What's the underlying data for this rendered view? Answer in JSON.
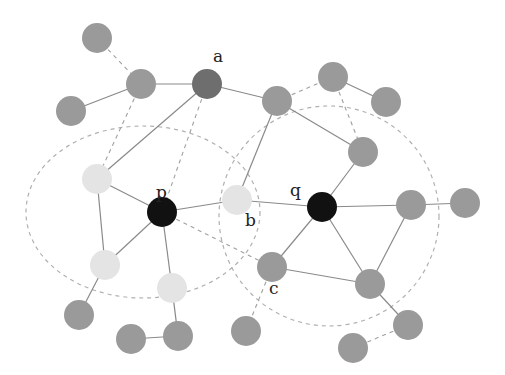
{
  "diagram": {
    "colors": {
      "background": "#ffffff",
      "node_dark": "#111111",
      "node_medium": "#6e6e6e",
      "node_gray": "#9a9a9a",
      "node_light": "#e4e4e4",
      "edge_solid": "#8a8a8a",
      "edge_dashed": "#a0a0a0",
      "region": "#b0b0b0"
    },
    "labels": {
      "a": "a",
      "p": "p",
      "q": "q",
      "b": "b",
      "c": "c"
    },
    "nodes": [
      {
        "id": "n1",
        "x": 97,
        "y": 38,
        "type": "gray"
      },
      {
        "id": "n2",
        "x": 71,
        "y": 111,
        "type": "gray"
      },
      {
        "id": "n3",
        "x": 141,
        "y": 84,
        "type": "gray"
      },
      {
        "id": "a",
        "x": 207,
        "y": 84,
        "type": "medium",
        "label": "a"
      },
      {
        "id": "n5",
        "x": 277,
        "y": 101,
        "type": "gray"
      },
      {
        "id": "n6",
        "x": 333,
        "y": 77,
        "type": "gray"
      },
      {
        "id": "n7",
        "x": 386,
        "y": 102,
        "type": "gray"
      },
      {
        "id": "n8",
        "x": 363,
        "y": 152,
        "type": "gray"
      },
      {
        "id": "l1",
        "x": 97,
        "y": 179,
        "type": "light"
      },
      {
        "id": "p",
        "x": 162,
        "y": 212,
        "type": "dark",
        "label": "p"
      },
      {
        "id": "b",
        "x": 237,
        "y": 200,
        "type": "light",
        "label": "b"
      },
      {
        "id": "q",
        "x": 322,
        "y": 207,
        "type": "dark",
        "label": "q"
      },
      {
        "id": "n12",
        "x": 411,
        "y": 205,
        "type": "gray"
      },
      {
        "id": "n13",
        "x": 465,
        "y": 203,
        "type": "gray"
      },
      {
        "id": "c",
        "x": 272,
        "y": 267,
        "type": "gray",
        "label": "c"
      },
      {
        "id": "n15",
        "x": 370,
        "y": 284,
        "type": "gray"
      },
      {
        "id": "l2",
        "x": 105,
        "y": 265,
        "type": "light"
      },
      {
        "id": "l3",
        "x": 172,
        "y": 288,
        "type": "light"
      },
      {
        "id": "n18",
        "x": 79,
        "y": 315,
        "type": "gray"
      },
      {
        "id": "n19",
        "x": 131,
        "y": 339,
        "type": "gray"
      },
      {
        "id": "n20",
        "x": 178,
        "y": 336,
        "type": "gray"
      },
      {
        "id": "n21",
        "x": 246,
        "y": 331,
        "type": "gray"
      },
      {
        "id": "n22",
        "x": 408,
        "y": 325,
        "type": "gray"
      },
      {
        "id": "n23",
        "x": 353,
        "y": 348,
        "type": "gray"
      }
    ],
    "edges": [
      {
        "from": "n2",
        "to": "n3",
        "style": "solid"
      },
      {
        "from": "n3",
        "to": "a",
        "style": "solid"
      },
      {
        "from": "n1",
        "to": "n3",
        "style": "dashed"
      },
      {
        "from": "a",
        "to": "n5",
        "style": "solid"
      },
      {
        "from": "a",
        "to": "l1",
        "style": "solid"
      },
      {
        "from": "a",
        "to": "p",
        "style": "dashed"
      },
      {
        "from": "n3",
        "to": "l1",
        "style": "dashed"
      },
      {
        "from": "n5",
        "to": "n6",
        "style": "dashed"
      },
      {
        "from": "n6",
        "to": "n7",
        "style": "solid"
      },
      {
        "from": "n6",
        "to": "n8",
        "style": "dashed"
      },
      {
        "from": "n5",
        "to": "n8",
        "style": "solid"
      },
      {
        "from": "n5",
        "to": "b",
        "style": "solid"
      },
      {
        "from": "n8",
        "to": "q",
        "style": "solid"
      },
      {
        "from": "l1",
        "to": "p",
        "style": "solid"
      },
      {
        "from": "l1",
        "to": "l2",
        "style": "solid"
      },
      {
        "from": "p",
        "to": "b",
        "style": "solid"
      },
      {
        "from": "p",
        "to": "l2",
        "style": "solid"
      },
      {
        "from": "p",
        "to": "l3",
        "style": "solid"
      },
      {
        "from": "p",
        "to": "c",
        "style": "dashed"
      },
      {
        "from": "b",
        "to": "q",
        "style": "solid"
      },
      {
        "from": "q",
        "to": "n12",
        "style": "solid"
      },
      {
        "from": "q",
        "to": "c",
        "style": "solid"
      },
      {
        "from": "q",
        "to": "n15",
        "style": "solid"
      },
      {
        "from": "n12",
        "to": "n13",
        "style": "solid"
      },
      {
        "from": "n12",
        "to": "n15",
        "style": "solid"
      },
      {
        "from": "c",
        "to": "n15",
        "style": "solid"
      },
      {
        "from": "c",
        "to": "n21",
        "style": "dashed"
      },
      {
        "from": "n15",
        "to": "n22",
        "style": "solid"
      },
      {
        "from": "n22",
        "to": "n23",
        "style": "dashed"
      },
      {
        "from": "l2",
        "to": "n18",
        "style": "solid"
      },
      {
        "from": "l3",
        "to": "n20",
        "style": "solid"
      },
      {
        "from": "n19",
        "to": "n20",
        "style": "solid"
      }
    ],
    "regions": [
      {
        "id": "region-p",
        "cx": 143,
        "cy": 212,
        "rx": 117,
        "ry": 86
      },
      {
        "id": "region-q",
        "cx": 329,
        "cy": 216,
        "rx": 110,
        "ry": 110
      }
    ],
    "node_radius": 15
  }
}
